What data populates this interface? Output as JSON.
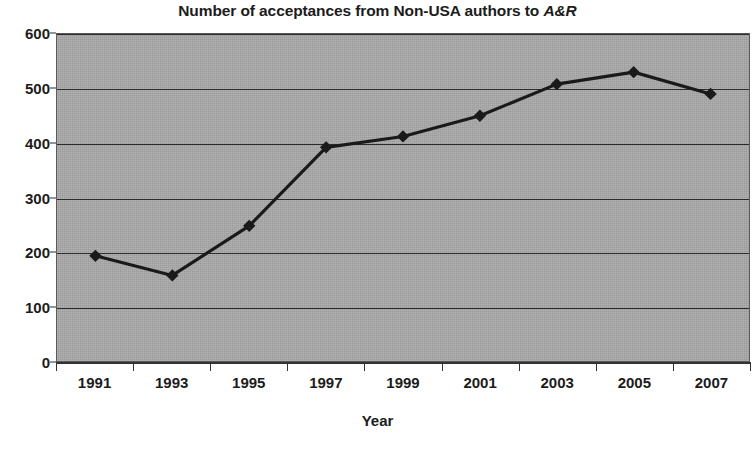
{
  "chart_data": {
    "type": "line",
    "title_prefix": "Number of acceptances from Non-USA authors to ",
    "title_emphasis": "A&R",
    "title": "Number of acceptances from Non-USA authors to A&R",
    "xlabel": "Year",
    "ylabel": "",
    "categories": [
      "1991",
      "1993",
      "1995",
      "1997",
      "1999",
      "2001",
      "2003",
      "2005",
      "2007"
    ],
    "x": [
      1991,
      1993,
      1995,
      1997,
      1999,
      2001,
      2003,
      2005,
      2007
    ],
    "values": [
      193,
      157,
      248,
      392,
      412,
      450,
      508,
      530,
      490
    ],
    "series": [
      {
        "name": "Acceptances from Non-USA authors",
        "values": [
          193,
          157,
          248,
          392,
          412,
          450,
          508,
          530,
          490
        ]
      }
    ],
    "ylim": [
      0,
      600
    ],
    "ytick_values": [
      0,
      100,
      200,
      300,
      400,
      500,
      600
    ],
    "ytick_labels": [
      "0",
      "100",
      "200",
      "300",
      "400",
      "500",
      "600"
    ],
    "grid": true,
    "legend": false,
    "legend_position": "none",
    "marker": "diamond",
    "series_color": "#1a1a1a",
    "plot_background_color": "#a9a9a9",
    "grid_color": "#2b2b2b",
    "axis_color": "#333333",
    "text_color": "#1c1c1c"
  }
}
